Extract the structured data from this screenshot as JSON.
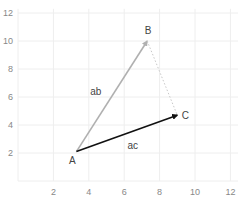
{
  "chart_data": {
    "type": "vector-diagram",
    "title": "",
    "xlabel": "",
    "ylabel": "",
    "xlim": [
      0,
      12.5
    ],
    "ylim": [
      0,
      12.3
    ],
    "grid": true,
    "x_ticks": [
      2,
      4,
      6,
      8,
      10,
      12
    ],
    "y_ticks": [
      2,
      4,
      6,
      8,
      10,
      12
    ],
    "points": [
      {
        "label": "A",
        "x": 3.3,
        "y": 2.1
      },
      {
        "label": "B",
        "x": 7.3,
        "y": 10.0
      },
      {
        "label": "C",
        "x": 9.0,
        "y": 4.7
      }
    ],
    "segments": [
      {
        "label": "ab",
        "from": "A",
        "to": "B",
        "color": "#b0b0b0",
        "style": "solid",
        "arrow": true
      },
      {
        "label": "ac",
        "from": "A",
        "to": "C",
        "color": "#111111",
        "style": "solid",
        "arrow": true
      },
      {
        "label": "",
        "from": "B",
        "to": "C",
        "color": "#c8c8c8",
        "style": "dotted",
        "arrow": false
      }
    ]
  },
  "colors": {
    "grid": "#eeeeee",
    "tick_text": "#888888",
    "label_text": "#444444"
  }
}
